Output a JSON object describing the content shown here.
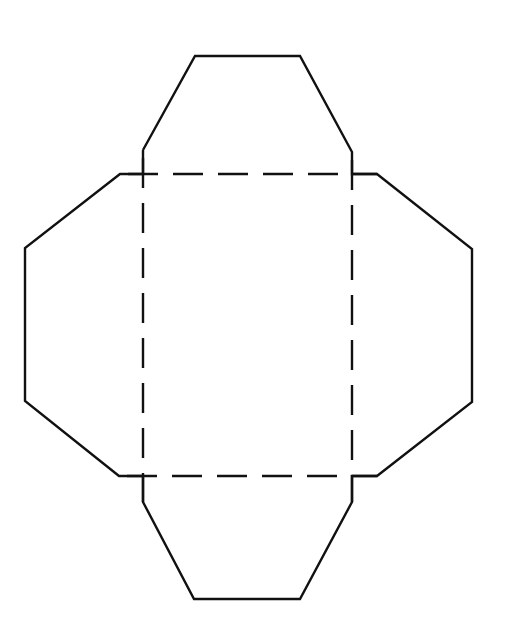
{
  "diagram": {
    "type": "box-net-template",
    "stroke_color": "#111111",
    "background": "#ffffff",
    "outline_solid": {
      "points": "143,150 195,56 300,56 352,152 352,174 377,174 472,249 472,402 377,476 352,476 352,502 300,599 194,599 143,502 143,476 119,476 25,401 25,248 120,174 143,174 143,150"
    },
    "fold_square": {
      "x1": 143,
      "y1": 174,
      "x2": 352,
      "y2": 476,
      "dash_pattern": "30 15"
    },
    "flaps": [
      {
        "name": "top-flap",
        "points": "143,174 143,150 195,56 300,56 352,152 352,174"
      },
      {
        "name": "right-flap",
        "points": "352,174 377,174 472,249 472,402 377,476 352,476"
      },
      {
        "name": "bottom-flap",
        "points": "143,476 143,502 194,599 300,599 352,502 352,476"
      },
      {
        "name": "left-flap",
        "points": "143,174 120,174 25,248 25,401 119,476 143,476"
      }
    ]
  }
}
